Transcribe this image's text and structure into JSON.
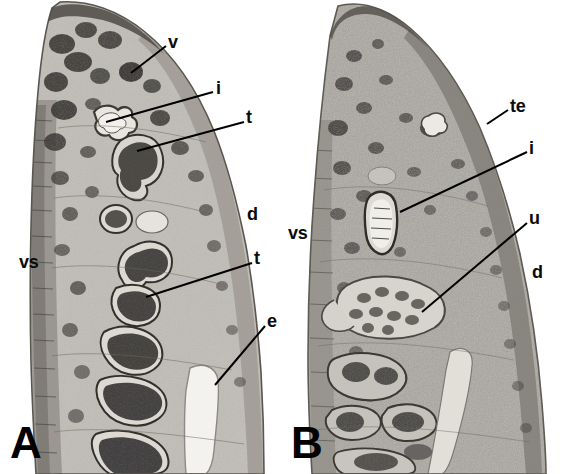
{
  "figure": {
    "type": "histological-section-micrograph",
    "background_color": "#ffffff",
    "panel_count": 2,
    "ink_color": "#0a0a0a"
  },
  "panels": [
    {
      "id": "A",
      "letter": "A",
      "side": "left",
      "tissue_tone": "grayscale",
      "labels": [
        {
          "key": "v",
          "text": "v",
          "meaning": "vitelline-follicles",
          "x": 168,
          "y": 33,
          "size": "md",
          "leader": {
            "x1": 166,
            "y1": 46,
            "x2": 131,
            "y2": 73
          }
        },
        {
          "key": "i",
          "text": "i",
          "meaning": "intestine",
          "x": 216,
          "y": 79,
          "size": "md",
          "leader": {
            "x1": 213,
            "y1": 92,
            "x2": 106,
            "y2": 122
          }
        },
        {
          "key": "t1",
          "text": "t",
          "meaning": "testis",
          "x": 246,
          "y": 108,
          "size": "md",
          "leader": {
            "x1": 244,
            "y1": 122,
            "x2": 137,
            "y2": 151
          }
        },
        {
          "key": "d",
          "text": "d",
          "meaning": "dorsal-surface",
          "x": 247,
          "y": 205,
          "size": "md",
          "leader": null
        },
        {
          "key": "vs",
          "text": "vs",
          "meaning": "ventral-surface",
          "x": 19,
          "y": 253,
          "size": "md",
          "leader": null
        },
        {
          "key": "t2",
          "text": "t",
          "meaning": "testis",
          "x": 254,
          "y": 249,
          "size": "md",
          "leader": {
            "x1": 252,
            "y1": 263,
            "x2": 146,
            "y2": 297
          }
        },
        {
          "key": "e",
          "text": "e",
          "meaning": "excretory-vesicle",
          "x": 267,
          "y": 312,
          "size": "md",
          "leader": {
            "x1": 265,
            "y1": 326,
            "x2": 215,
            "y2": 385
          }
        }
      ]
    },
    {
      "id": "B",
      "letter": "B",
      "side": "right",
      "tissue_tone": "grayscale",
      "labels": [
        {
          "key": "te",
          "text": "te",
          "meaning": "tegument",
          "x": 510,
          "y": 97,
          "size": "md",
          "leader": {
            "x1": 508,
            "y1": 110,
            "x2": 487,
            "y2": 124
          }
        },
        {
          "key": "i",
          "text": "i",
          "meaning": "intestine",
          "x": 529,
          "y": 139,
          "size": "md",
          "leader": {
            "x1": 527,
            "y1": 152,
            "x2": 400,
            "y2": 212
          }
        },
        {
          "key": "u",
          "text": "u",
          "meaning": "uterus",
          "x": 529,
          "y": 209,
          "size": "md",
          "leader": {
            "x1": 527,
            "y1": 223,
            "x2": 422,
            "y2": 312
          }
        },
        {
          "key": "vs",
          "text": "vs",
          "meaning": "ventral-surface",
          "x": 288,
          "y": 224,
          "size": "md",
          "leader": null
        },
        {
          "key": "d",
          "text": "d",
          "meaning": "dorsal-surface",
          "x": 532,
          "y": 263,
          "size": "md",
          "leader": null
        }
      ]
    }
  ],
  "panel_letters": [
    {
      "letter": "A",
      "x": 10,
      "y": 421
    },
    {
      "letter": "B",
      "x": 291,
      "y": 421
    }
  ]
}
